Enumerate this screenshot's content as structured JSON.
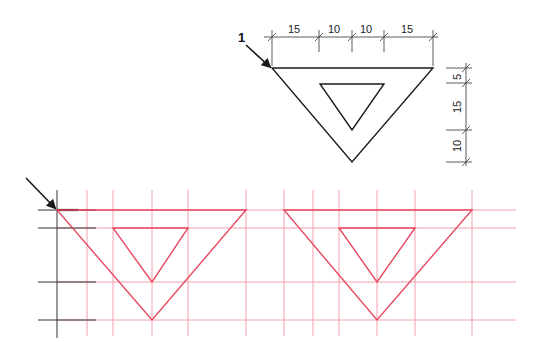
{
  "figure": {
    "callout_label": "1",
    "horizontal_dimensions": [
      "15",
      "10",
      "10",
      "15"
    ],
    "vertical_dimensions": [
      "5",
      "15",
      "10"
    ]
  },
  "colors": {
    "ink": "#1a1a1a",
    "construction": "#f08a98",
    "drawing": "#e8475f"
  }
}
